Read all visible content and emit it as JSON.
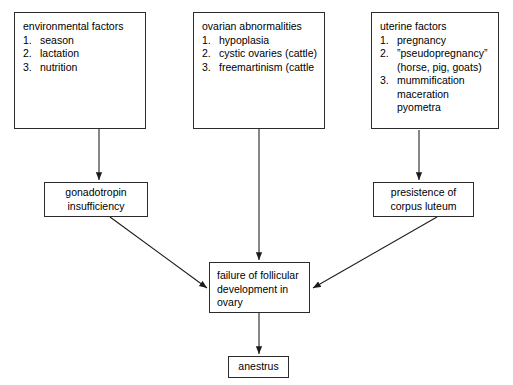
{
  "diagram": {
    "stroke_color": "#2b2b2b",
    "background_color": "#ffffff"
  },
  "sources": [
    {
      "id": "environmental-factors",
      "header": "environmental factors",
      "items": [
        {
          "num": "1.",
          "text": "season"
        },
        {
          "num": "2.",
          "text": "lactation"
        },
        {
          "num": "3.",
          "text": "nutrition"
        }
      ]
    },
    {
      "id": "ovarian-abnormalities",
      "header": "ovarian abnormalities",
      "items": [
        {
          "num": "1.",
          "text": "hypoplasia"
        },
        {
          "num": "2.",
          "text": "cystic ovaries (cattle)"
        },
        {
          "num": "3.",
          "text": "freemartinism (cattle"
        }
      ]
    },
    {
      "id": "uterine-factors",
      "header": "uterine factors",
      "items": [
        {
          "num": "1.",
          "text": "pregnancy"
        },
        {
          "num": "2.",
          "text": "”pseudopregnancy”",
          "sub": "(horse, pig, goats)"
        },
        {
          "num": "3.",
          "text": "mummification",
          "sub": "maceration",
          "sub2": "pyometra"
        }
      ]
    }
  ],
  "intermediates": {
    "gonadotropin": {
      "line1": "gonadotropin",
      "line2": "insufficiency"
    },
    "corpus_luteum": {
      "line1": "presistence of",
      "line2": "corpus luteum"
    }
  },
  "focus": {
    "line1": "failure of follicular",
    "line2": "development in",
    "line3": "ovary"
  },
  "outcome": {
    "label": "anestrus"
  }
}
